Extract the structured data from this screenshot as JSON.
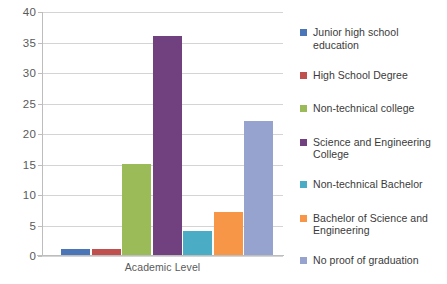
{
  "chart_data": {
    "type": "bar",
    "title": "",
    "subtitle": "",
    "xlabel": "Academic Level",
    "ylabel": "",
    "ylim": [
      0,
      40
    ],
    "ytick_step": 5,
    "yticks": [
      "0",
      "5",
      "10",
      "15",
      "20",
      "25",
      "30",
      "35",
      "40"
    ],
    "grid": true,
    "legend_position": "right",
    "categories": [
      "Junior high school education",
      "High School Degree",
      "Non-technical college",
      "Science and Engineering College",
      "Non-technical Bachelor",
      "Bachelor of Science and Engineering",
      "No proof of graduation"
    ],
    "values": [
      1,
      1,
      15,
      36,
      4,
      7,
      22
    ],
    "colors": [
      "#4A76B8",
      "#C0504D",
      "#9BBB59",
      "#70407F",
      "#4BACC6",
      "#F79646",
      "#95A3CE"
    ]
  },
  "legend": {
    "items": [
      {
        "label": "Junior high school education",
        "color": "#4A76B8"
      },
      {
        "label": "High School Degree",
        "color": "#C0504D"
      },
      {
        "label": "Non-technical college",
        "color": "#9BBB59"
      },
      {
        "label": "Science and Engineering College",
        "color": "#70407F"
      },
      {
        "label": "Non-technical Bachelor",
        "color": "#4BACC6"
      },
      {
        "label": "Bachelor of Science and Engineering",
        "color": "#F79646"
      },
      {
        "label": "No proof of graduation",
        "color": "#95A3CE"
      }
    ]
  }
}
